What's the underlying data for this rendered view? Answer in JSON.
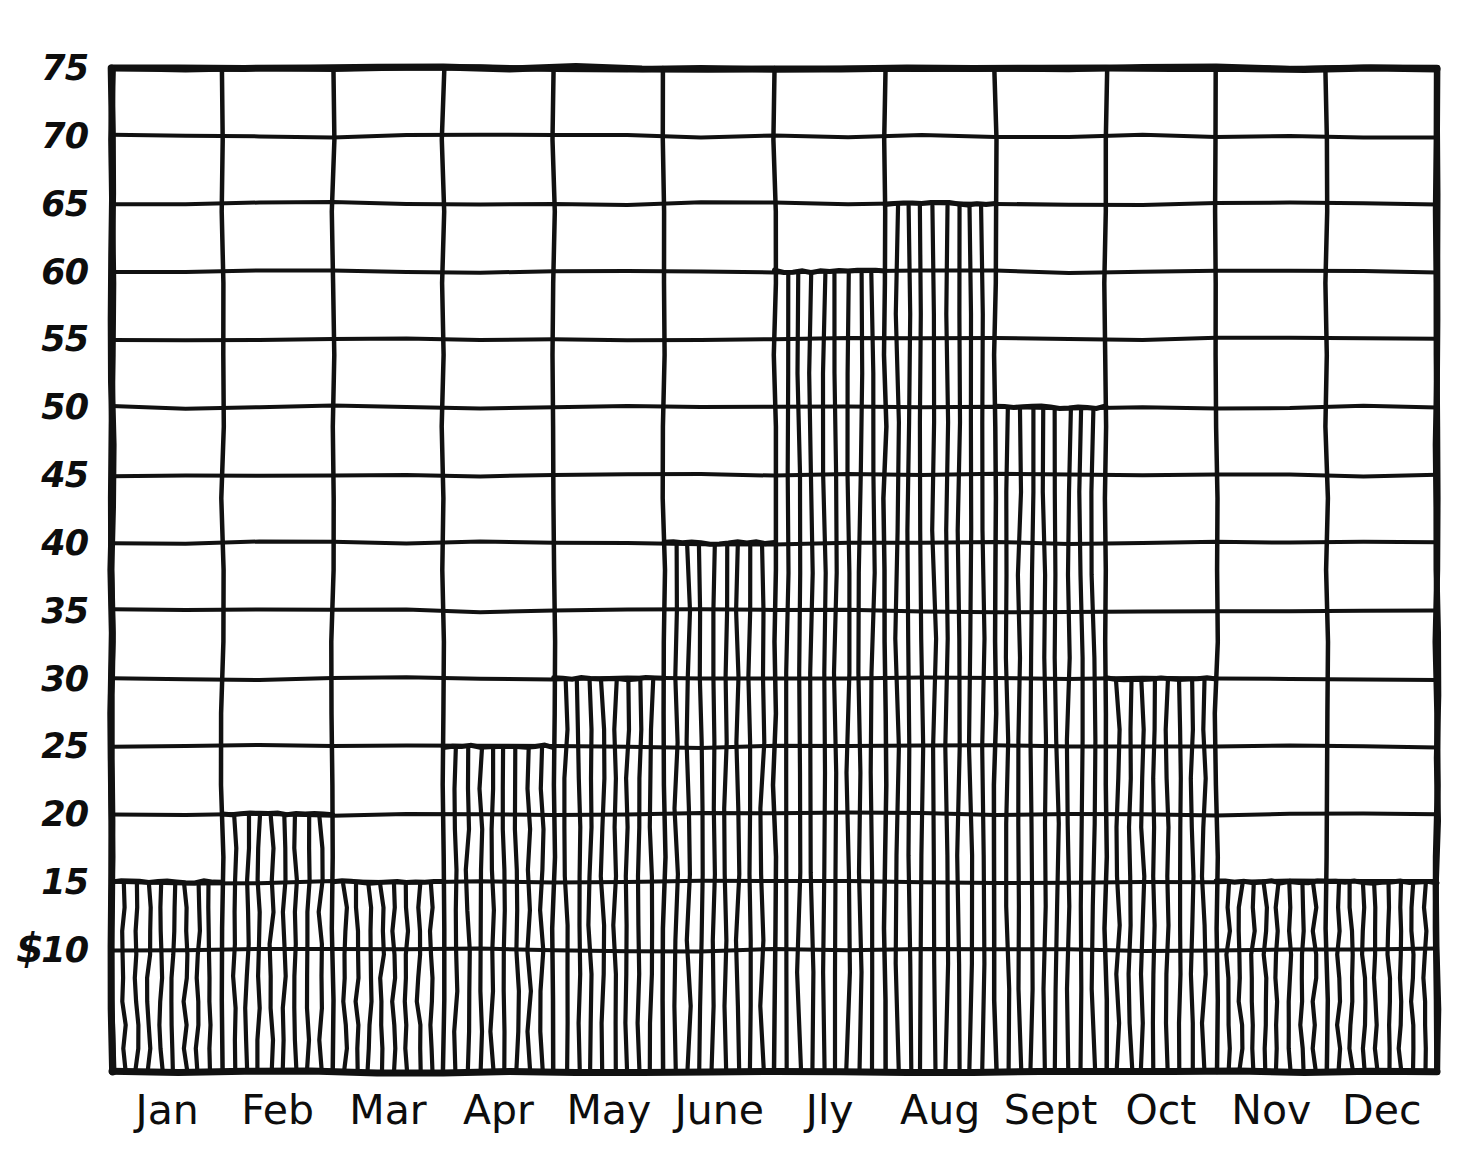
{
  "chart_data": {
    "type": "bar",
    "title": "",
    "xlabel": "",
    "ylabel": "$",
    "categories": [
      "Jan",
      "Feb",
      "Mar",
      "Apr",
      "May",
      "June",
      "Jly",
      "Aug",
      "Sept",
      "Oct",
      "Nov",
      "Dec"
    ],
    "values": [
      15,
      20,
      15,
      25,
      30,
      40,
      60,
      65,
      50,
      30,
      15,
      15
    ],
    "ylim": [
      0,
      75
    ],
    "ytick_labels": [
      "75",
      "70",
      "65",
      "60",
      "55",
      "50",
      "45",
      "40",
      "35",
      "30",
      "25",
      "20",
      "15",
      "10"
    ],
    "ytick_values": [
      75,
      70,
      65,
      60,
      55,
      50,
      45,
      40,
      35,
      30,
      25,
      20,
      15,
      10
    ],
    "ytick_step": 5,
    "grid": true,
    "legend": false,
    "currency_symbol": "$",
    "bar_fill": "vertical-hatch",
    "style": "hand-drawn",
    "line_color": "#111111",
    "background_color": "#ffffff"
  },
  "axes": {
    "y_label_prefix": "$",
    "x_axis_name": "Month",
    "y_axis_name": "Dollars"
  }
}
